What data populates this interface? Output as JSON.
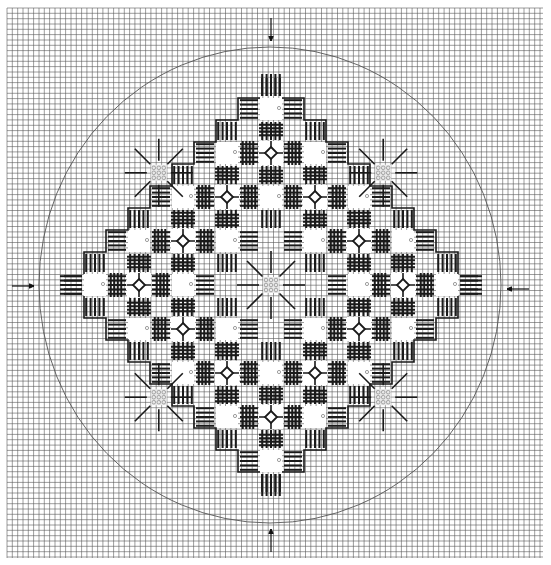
{
  "chart": {
    "canvas": {
      "width": 551,
      "height": 565
    },
    "grid": {
      "x0": 7,
      "y0": 8,
      "x1": 543,
      "y1": 558,
      "step": 5.33,
      "color": "#5a5a5a",
      "background": "#ffffff"
    },
    "circle": {
      "cx": 270,
      "cy": 285,
      "rx": 231,
      "ry": 238,
      "color": "#555555"
    },
    "arrows": [
      {
        "name": "top-arrow",
        "x1": 271,
        "y1": 18,
        "x2": 271,
        "y2": 41
      },
      {
        "name": "bottom-arrow",
        "x1": 271,
        "y1": 552,
        "x2": 271,
        "y2": 529
      },
      {
        "name": "left-arrow",
        "x1": 12,
        "y1": 286,
        "x2": 34,
        "y2": 286
      },
      {
        "name": "right-arrow",
        "x1": 529,
        "y1": 289,
        "x2": 507,
        "y2": 289
      }
    ],
    "center": {
      "x": 271,
      "y": 285
    },
    "unit": 44,
    "ink": "#1a1a1a",
    "motif_types": [
      "open-square",
      "diamond-eyelet",
      "starburst",
      "bar-cluster"
    ],
    "diamonds": [
      [
        0,
        -3
      ],
      [
        -1,
        -2
      ],
      [
        1,
        -2
      ],
      [
        -2,
        -1
      ],
      [
        2,
        -1
      ],
      [
        -3,
        0
      ],
      [
        3,
        0
      ],
      [
        -2,
        1
      ],
      [
        2,
        1
      ],
      [
        -1,
        2
      ],
      [
        1,
        2
      ],
      [
        0,
        3
      ]
    ],
    "open_squares": [
      [
        0,
        -4
      ],
      [
        -4,
        0
      ],
      [
        4,
        0
      ],
      [
        0,
        4
      ],
      [
        -1,
        -3
      ],
      [
        1,
        -3
      ],
      [
        -3,
        -1
      ],
      [
        3,
        -1
      ],
      [
        -3,
        1
      ],
      [
        3,
        1
      ],
      [
        -1,
        3
      ],
      [
        1,
        3
      ],
      [
        0,
        -2
      ],
      [
        -2,
        0
      ],
      [
        2,
        0
      ],
      [
        0,
        2
      ],
      [
        -1,
        -1
      ],
      [
        1,
        -1
      ],
      [
        -1,
        1
      ],
      [
        1,
        1
      ],
      [
        -2,
        -2
      ],
      [
        2,
        -2
      ],
      [
        -2,
        2
      ],
      [
        2,
        2
      ]
    ],
    "starbursts": [
      [
        0,
        0
      ],
      [
        -2.55,
        -2.55
      ],
      [
        2.55,
        -2.55
      ],
      [
        -2.55,
        2.55
      ],
      [
        2.55,
        2.55
      ]
    ],
    "tips": [
      {
        "dir": "top",
        "at": [
          0,
          -4
        ]
      },
      {
        "dir": "left",
        "at": [
          -4,
          0
        ]
      },
      {
        "dir": "right",
        "at": [
          4,
          0
        ]
      },
      {
        "dir": "bottom",
        "at": [
          0,
          4
        ]
      }
    ]
  }
}
